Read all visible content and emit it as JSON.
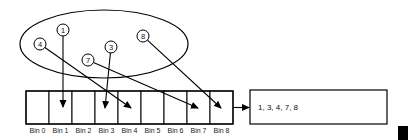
{
  "diagram": {
    "type": "hash-bins",
    "set": {
      "shape": "ellipse",
      "cx": 104,
      "cy": 44,
      "rx": 84,
      "ry": 34,
      "elements": [
        {
          "label": "1",
          "cx": 63,
          "cy": 30,
          "bin": 1,
          "to": [
            63,
            107
          ]
        },
        {
          "label": "4",
          "cx": 40,
          "cy": 44,
          "bin": 4,
          "to": [
            131,
            108
          ]
        },
        {
          "label": "3",
          "cx": 111,
          "cy": 47,
          "bin": 3,
          "to": [
            105,
            108
          ]
        },
        {
          "label": "7",
          "cx": 88,
          "cy": 60,
          "bin": 7,
          "to": [
            198,
            108
          ]
        },
        {
          "label": "8",
          "cx": 143,
          "cy": 36,
          "bin": 8,
          "to": [
            221,
            108
          ]
        }
      ]
    },
    "bins": {
      "x": 26,
      "y": 91,
      "width": 23,
      "height": 33,
      "labels": [
        "Bin 0",
        "Bin 1",
        "Bin 2",
        "Bin 3",
        "Bin 4",
        "Bin 5",
        "Bin 6",
        "Bin 7",
        "Bin 8"
      ]
    },
    "result": {
      "text": "1, 3, 4, 7, 8",
      "x": 250,
      "y": 90,
      "width": 137,
      "height": 34
    }
  }
}
